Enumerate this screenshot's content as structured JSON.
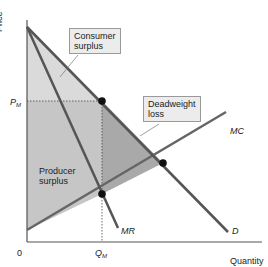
{
  "axes": {
    "y_label": "Price",
    "x_label": "Quantity",
    "origin": "0",
    "p_m": "P",
    "p_m_sub": "M",
    "q_m": "Q",
    "q_m_sub": "M"
  },
  "curves": {
    "mc": "MC",
    "mr": "MR",
    "d": "D"
  },
  "regions": {
    "consumer_surplus_line1": "Consumer",
    "consumer_surplus_line2": "surplus",
    "deadweight_line1": "Deadweight",
    "deadweight_line2": "loss",
    "producer_surplus_line1": "Producer",
    "producer_surplus_line2": "surplus"
  },
  "colors": {
    "consumer_fill": "#d9d9d9",
    "producer_fill": "#c4c4c4",
    "deadweight_fill": "#a8a8a8",
    "curve": "#555555"
  }
}
